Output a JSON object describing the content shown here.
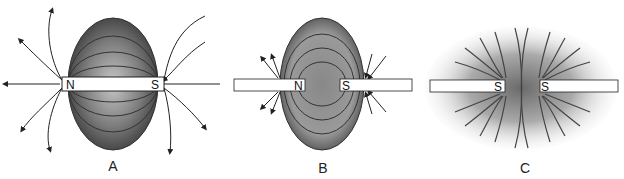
{
  "figure": {
    "panels": [
      {
        "label": "A",
        "left_pole": "N",
        "right_pole": "S",
        "description": "Single bar magnet with field lines from N to S"
      },
      {
        "label": "B",
        "left_pole": "N",
        "right_pole": "S",
        "description": "Two magnets with opposite poles facing (attraction)"
      },
      {
        "label": "C",
        "left_pole": "S",
        "right_pole": "S",
        "description": "Two magnets with like poles facing (repulsion)"
      }
    ]
  },
  "colors": {
    "field_dark": "#3a3a3a",
    "field_light": "#d8d8d8",
    "line": "#222222",
    "magnet": "#ffffff"
  }
}
